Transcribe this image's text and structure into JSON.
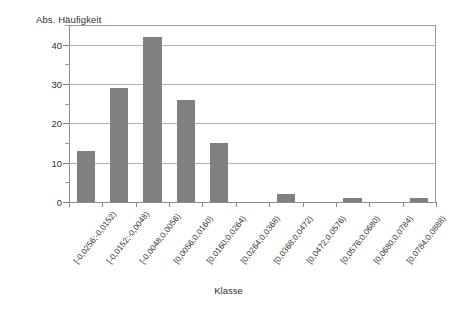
{
  "chart_data": {
    "type": "bar",
    "title": "",
    "subtitle": "",
    "xlabel": "Klasse",
    "ylabel": "Abs. Häufigkeit",
    "ylim": [
      0,
      45
    ],
    "yticks": [
      0,
      10,
      20,
      30,
      40
    ],
    "ytick_labels": [
      "0",
      "10",
      "20",
      "30",
      "40"
    ],
    "yminor_ticks": [
      5,
      15,
      25,
      35,
      45
    ],
    "grid": "horizontal",
    "legend": "none",
    "bar_color": "#808080",
    "plot_border_color": "#9a9a9a",
    "gridline_color": "#b4b4b4",
    "categories": [
      "[-0,0256;-0,0152)",
      "[-0,0152;-0,0048)",
      "[-0,0048;0,0056)",
      "[0,0056;0,0160)",
      "[0,0160;0,0264)",
      "[0,0264;0,0368)",
      "[0,0368;0,0472)",
      "[0,0472;0,0576)",
      "[0,0576;0,0680)",
      "[0,0680;0,0784)",
      "[0,0784;0,0888)"
    ],
    "values": [
      13,
      29,
      42,
      26,
      15,
      0,
      2,
      0,
      1,
      0,
      1
    ]
  }
}
